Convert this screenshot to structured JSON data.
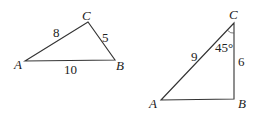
{
  "diagram": {
    "triangle1": {
      "vertices": {
        "A": "A",
        "B": "B",
        "C": "C"
      },
      "sides": {
        "AC": "8",
        "CB": "5",
        "AB": "10"
      }
    },
    "triangle2": {
      "vertices": {
        "A": "A",
        "B": "B",
        "C": "C"
      },
      "sides": {
        "AC": "9",
        "CB": "6"
      },
      "angle_C": "45°"
    },
    "colors": {
      "stroke": "#333333",
      "text": "#222222"
    }
  }
}
